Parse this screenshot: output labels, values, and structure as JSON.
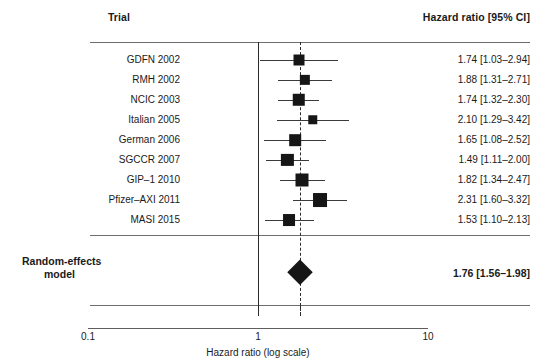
{
  "header": {
    "trial_label": "Trial",
    "hazard_ratio_label": "Hazard ratio [95% CI]"
  },
  "summary": {
    "label_line1": "Random-effects",
    "label_line2": "model",
    "value": "1.76 [1.56–1.98]"
  },
  "axis": {
    "title": "Hazard ratio (log scale)",
    "tick_min": "0.1",
    "tick_null": "1",
    "tick_max": "10"
  },
  "chart_data": {
    "type": "forest",
    "title": "",
    "xlabel": "Hazard ratio (log scale)",
    "ylabel": "",
    "scale": "log",
    "xlim": [
      0.1,
      10
    ],
    "xticks": [
      0.1,
      1,
      10
    ],
    "xticklabels": [
      "0.1",
      "1",
      "10"
    ],
    "reference_line": 1,
    "pooled_line": 1.76,
    "grid": false,
    "legend": "none",
    "columns": [
      "Trial",
      "Hazard ratio [95% CI]"
    ],
    "studies": [
      {
        "trial": "GDFN 2002",
        "estimate": 1.74,
        "ci_low": 1.03,
        "ci_high": 2.94,
        "weight": 0.09,
        "value": "1.74 [1.03–2.94]"
      },
      {
        "trial": "RMH 2002",
        "estimate": 1.88,
        "ci_low": 1.31,
        "ci_high": 2.71,
        "weight": 0.07,
        "value": "1.88 [1.31–2.71]"
      },
      {
        "trial": "NCIC 2003",
        "estimate": 1.74,
        "ci_low": 1.32,
        "ci_high": 2.3,
        "weight": 0.14,
        "value": "1.74 [1.32–2.30]"
      },
      {
        "trial": "Italian 2005",
        "estimate": 2.1,
        "ci_low": 1.29,
        "ci_high": 3.42,
        "weight": 0.05,
        "value": "2.10 [1.29–3.42]"
      },
      {
        "trial": "German 2006",
        "estimate": 1.65,
        "ci_low": 1.08,
        "ci_high": 2.52,
        "weight": 0.11,
        "value": "1.65 [1.08–2.52]"
      },
      {
        "trial": "SGCCR 2007",
        "estimate": 1.49,
        "ci_low": 1.11,
        "ci_high": 2.0,
        "weight": 0.13,
        "value": "1.49 [1.11–2.00]"
      },
      {
        "trial": "GIP–1 2010",
        "estimate": 1.82,
        "ci_low": 1.34,
        "ci_high": 2.47,
        "weight": 0.16,
        "value": "1.82 [1.34–2.47]"
      },
      {
        "trial": "Pfizer–AXI 2011",
        "estimate": 2.31,
        "ci_low": 1.6,
        "ci_high": 3.32,
        "weight": 0.2,
        "value": "2.31 [1.60–3.32]"
      },
      {
        "trial": "MASI 2015",
        "estimate": 1.53,
        "ci_low": 1.1,
        "ci_high": 2.13,
        "weight": 0.12,
        "value": "1.53 [1.10–2.13]"
      }
    ],
    "pooled": {
      "label": "Random-effects model",
      "estimate": 1.76,
      "ci_low": 1.56,
      "ci_high": 1.98,
      "value": "1.76 [1.56–1.98]"
    }
  }
}
